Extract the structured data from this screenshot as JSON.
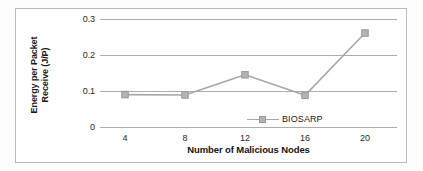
{
  "chart_data": {
    "type": "line",
    "title": "",
    "subtitle": "",
    "xlabel": "Number of Malicious Nodes",
    "ylabel": "Energy per Packet Receive (J/P)",
    "ylabel_line1": "Energy per Packet",
    "ylabel_line2": "Receive (J/P)",
    "categories": [
      "4",
      "8",
      "12",
      "16",
      "20"
    ],
    "x": [
      4,
      8,
      12,
      16,
      20
    ],
    "series": [
      {
        "name": "BIOSARP",
        "values": [
          0.09,
          0.089,
          0.145,
          0.088,
          0.261
        ]
      }
    ],
    "ylim": [
      0,
      0.3
    ],
    "yticks": [
      "0.3",
      "0.2",
      "0.1",
      "0"
    ],
    "ytick_values": [
      0.3,
      0.2,
      0.1,
      0
    ],
    "grid": true,
    "grid_axis": "y",
    "legend": {
      "position": "inside-lower-right",
      "entries": [
        "BIOSARP"
      ]
    },
    "colors": {
      "series_line": "#a8a8a8",
      "series_marker": "#b3b3b3",
      "marker_border": "#9a9a9a",
      "gridline": "#adadad",
      "frame": "#b9b9b9",
      "text": "#1a1a1a",
      "background": "#ffffff"
    },
    "marker_shape": "square"
  },
  "legend": {
    "label": "BIOSARP"
  },
  "axes": {
    "y_title_line1": "Energy per Packet",
    "y_title_line2": "Receive (J/P)",
    "x_title": "Number of Malicious Nodes",
    "y_ticks": [
      "0.3",
      "0.2",
      "0.1",
      "0"
    ],
    "x_ticks": [
      "4",
      "8",
      "12",
      "16",
      "20"
    ]
  }
}
